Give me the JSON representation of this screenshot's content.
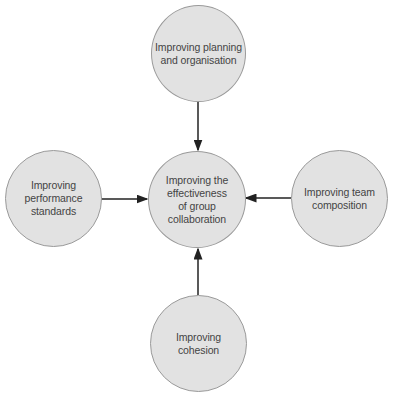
{
  "diagram": {
    "type": "hub-and-spoke",
    "colors": {
      "node_fill": "#e2e2e2",
      "node_stroke": "#9a9a9a",
      "arrow": "#222222",
      "text": "#444444"
    },
    "center": {
      "label": "Improving the effectiveness of group collaboration",
      "lines": [
        "Improving the",
        "effectiveness",
        "of group",
        "collaboration"
      ]
    },
    "nodes": [
      {
        "id": "top",
        "label": "Improving planning and organisation",
        "lines": [
          "Improving planning",
          "and organisation"
        ],
        "arrow_to": "center"
      },
      {
        "id": "left",
        "label": "Improving performance standards",
        "lines": [
          "Improving",
          "performance",
          "standards"
        ],
        "arrow_to": "center"
      },
      {
        "id": "right",
        "label": "Improving team composition",
        "lines": [
          "Improving team",
          "composition"
        ],
        "arrow_to": "center"
      },
      {
        "id": "bottom",
        "label": "Improving cohesion",
        "lines": [
          "Improving",
          "cohesion"
        ],
        "arrow_to": "center"
      }
    ]
  }
}
